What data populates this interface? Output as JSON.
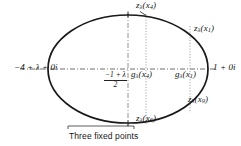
{
  "figure": {
    "caption": "Three fixed points",
    "colors": {
      "ink": "#121212",
      "curve": "#1a1a1a",
      "axis": "#444444",
      "guide": "#777777",
      "background": "#ffffff"
    },
    "ellipse": {
      "center_x": 128,
      "center_y": 69,
      "radius_x": 80,
      "radius_y": 54,
      "stroke_width": 1.6
    },
    "axis": {
      "style": "dash-dot",
      "y": 69,
      "x_start": 20,
      "x_end": 216,
      "left_label": "−4 + λ + 0i",
      "right_label": "1 + 0i"
    },
    "guides": [
      {
        "name": "center-vertical",
        "x": 128,
        "style": "dash-dot",
        "y_start": 14,
        "y_end": 124
      },
      {
        "name": "x4-vertical",
        "x": 146,
        "style": "dotted",
        "y_start": 14,
        "y_end": 124
      },
      {
        "name": "x1-vertical",
        "x": 190,
        "style": "dotted",
        "y_start": 26,
        "y_end": 112
      }
    ],
    "labels": {
      "top_x4": {
        "text": "zλ(x4)",
        "base": "z",
        "sub": "λ",
        "arg": "(x",
        "argsub": "4",
        "close": ")"
      },
      "right_x1": "zλ(x1)",
      "lower_right_x9": "zλ(x9)",
      "bottom_x6": "zλ(x6)",
      "axis_g_x4": "gλ(x4)",
      "axis_g_x1": "gλ(x1)",
      "midpoint_fraction": {
        "numerator": "−1 + λ",
        "denominator": "2"
      }
    },
    "bracket": {
      "x_start": 68,
      "x_end": 134,
      "y": 126,
      "label": "Three fixed points"
    },
    "tick_marks": [
      {
        "name": "top-tick",
        "x": 128,
        "y": 14
      },
      {
        "name": "bottom-tick",
        "x": 128,
        "y": 124
      }
    ]
  }
}
